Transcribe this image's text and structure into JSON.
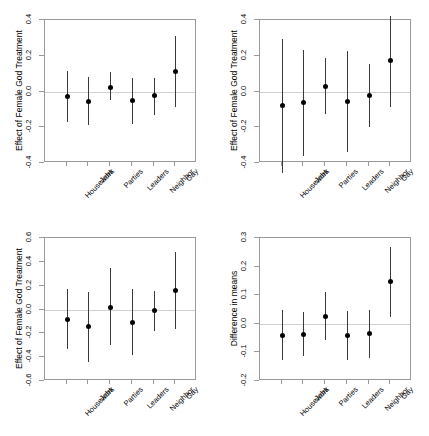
{
  "figure": {
    "background": "#ffffff",
    "axis_color": "#9a9a9a",
    "point_color": "#000000",
    "bar_color": "#3a3a3a",
    "zero_line_color": "#cfcfcf",
    "layout": "2x2 grid of coefficient plots with 95% confidence intervals"
  },
  "chart_data": [
    {
      "id": "panel-top-left",
      "type": "scatter",
      "subtype": "coefficient-plot-with-error-bars",
      "title": "",
      "xlabel": "",
      "ylabel": "Effect of Female God Treatment",
      "ylim": [
        -0.4,
        0.4
      ],
      "yticks": [
        0.4,
        0.2,
        0.0,
        -0.2,
        -0.4
      ],
      "ytick_labels": [
        "0.4",
        "0.2",
        "0.0",
        "-0.2",
        "-0.4"
      ],
      "grid": false,
      "legend": "none",
      "zero_reference_line": 0.0,
      "categories": [
        "Housework",
        "Jobs",
        "Parties",
        "Leaders",
        "Neighbor",
        "Gay"
      ],
      "values": [
        -0.03,
        -0.055,
        0.02,
        -0.05,
        -0.02,
        0.11
      ],
      "ci_lower": [
        -0.17,
        -0.188,
        -0.048,
        -0.183,
        -0.132,
        -0.088
      ],
      "ci_upper": [
        0.112,
        0.082,
        0.11,
        0.078,
        0.078,
        0.31
      ]
    },
    {
      "id": "panel-top-right",
      "type": "scatter",
      "subtype": "coefficient-plot-with-error-bars",
      "title": "",
      "xlabel": "",
      "ylabel": "Effect of Female God Treatment",
      "ylim": [
        -0.4,
        0.4
      ],
      "yticks": [
        0.4,
        0.2,
        0.0,
        -0.2,
        -0.4
      ],
      "ytick_labels": [
        "0.4",
        "0.2",
        "0.0",
        "-0.2",
        "-0.4"
      ],
      "grid": false,
      "legend": "none",
      "zero_reference_line": 0.0,
      "categories": [
        "Housework",
        "Jobs",
        "Parties",
        "Leaders",
        "Neighbor",
        "Gay"
      ],
      "values": [
        -0.08,
        -0.06,
        0.03,
        -0.055,
        -0.022,
        0.175
      ],
      "ci_lower": [
        -0.455,
        -0.36,
        -0.128,
        -0.34,
        -0.2,
        -0.088
      ],
      "ci_upper": [
        0.295,
        0.232,
        0.19,
        0.225,
        0.152,
        0.425
      ]
    },
    {
      "id": "panel-bottom-left",
      "type": "scatter",
      "subtype": "coefficient-plot-with-error-bars",
      "title": "",
      "xlabel": "",
      "ylabel": "Effect of Female God Treatment",
      "ylim": [
        -0.6,
        0.6
      ],
      "yticks": [
        0.6,
        0.4,
        0.2,
        0.0,
        -0.2,
        -0.4,
        -0.6
      ],
      "ytick_labels": [
        "0.6",
        "0.4",
        "0.2",
        "0.0",
        "-0.2",
        "-0.4",
        "-0.6"
      ],
      "grid": false,
      "legend": "none",
      "zero_reference_line": 0.0,
      "categories": [
        "Housework",
        "Jobs",
        "Parties",
        "Leaders",
        "Neighbor",
        "Gay"
      ],
      "values": [
        -0.08,
        -0.14,
        0.02,
        -0.11,
        -0.01,
        0.16
      ],
      "ci_lower": [
        -0.33,
        -0.44,
        -0.3,
        -0.38,
        -0.18,
        -0.16
      ],
      "ci_upper": [
        0.175,
        0.15,
        0.35,
        0.17,
        0.155,
        0.48
      ]
    },
    {
      "id": "panel-bottom-right",
      "type": "scatter",
      "subtype": "coefficient-plot-with-error-bars",
      "title": "",
      "xlabel": "",
      "ylabel": "Difference in means",
      "ylim": [
        -0.2,
        0.3
      ],
      "yticks": [
        0.3,
        0.2,
        0.1,
        0.0,
        -0.1,
        -0.2
      ],
      "ytick_labels": [
        "0.3",
        "0.2",
        "0.1",
        "0.0",
        "-0.1",
        "-0.2"
      ],
      "grid": false,
      "legend": "none",
      "zero_reference_line": 0.0,
      "categories": [
        "Housework",
        "Jobs",
        "Parties",
        "Leaders",
        "Neighbor",
        "Gay"
      ],
      "values": [
        -0.04,
        -0.036,
        0.027,
        -0.042,
        -0.033,
        0.148
      ],
      "ci_lower": [
        -0.128,
        -0.112,
        -0.055,
        -0.125,
        -0.118,
        0.022
      ],
      "ci_upper": [
        0.05,
        0.04,
        0.11,
        0.046,
        0.05,
        0.268
      ]
    }
  ]
}
